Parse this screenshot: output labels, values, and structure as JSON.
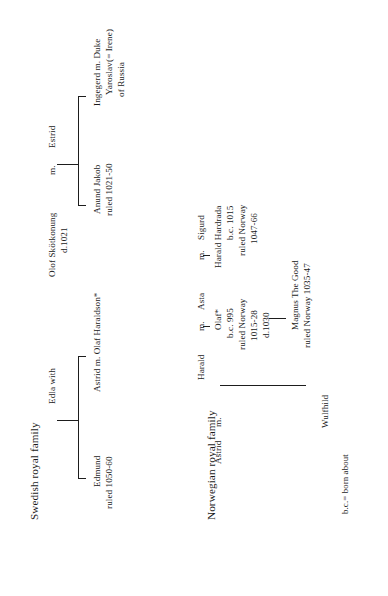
{
  "document": {
    "type": "genealogy-chart",
    "orientation": "rotated-90-ccw",
    "background_color": "#ffffff",
    "text_color": "#1a1a1a",
    "rule_color": "#1d1d1d"
  },
  "swedish": {
    "title": "Swedish royal family",
    "edla": "Edla  with",
    "olof_name": "Olof Skötkonung",
    "olof_death": "d.1021",
    "olof_marriage": "m.",
    "estrid": "Estrid",
    "edmund_name": "Edmund",
    "edmund_rule": "ruled 1050-60",
    "astrid_line": "Astrid  m.  Olaf Haraldson*",
    "anund_name": "Anund Jakob",
    "anund_rule": "ruled 1021-50",
    "ingegerd_line": "Ingegerd  m.  Duke",
    "ingegerd_l2": "Yaroslav",
    "ingegerd_l3": "of Russia",
    "ingegerd_alias": "(= Irene)"
  },
  "norwegian": {
    "title": "Norwegian royal family",
    "harald": "Harald",
    "harald_m": "m.",
    "asta": "Asta",
    "asta_m": "m.",
    "sigurd": "Sigurd",
    "olaf_name": "Olaf*",
    "olaf_born": "b.c. 995",
    "olaf_rule1": "ruled Norway",
    "olaf_rule2": "1015-28",
    "olaf_death": "d.1030",
    "hardrada_name": "Harald Hardrada",
    "hardrada_born": "b.c. 1015",
    "hardrada_rule1": "ruled Norway",
    "hardrada_rule2": "1047-66",
    "magnus_name": "Magnus The Good",
    "magnus_rule": "ruled Norway 1035-47",
    "astrid": "Astrid",
    "astrid_m": "m.",
    "wulfhild": "Wulfhild"
  },
  "legend": {
    "key": "b.c.= born about"
  }
}
